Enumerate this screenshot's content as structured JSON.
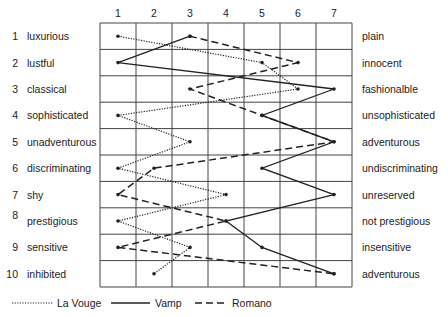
{
  "chart_data": {
    "type": "line",
    "title": "",
    "xlabel": "",
    "ylabel": "",
    "x_ticks": [
      "1",
      "2",
      "3",
      "4",
      "5",
      "6",
      "7"
    ],
    "xlim": [
      1,
      7
    ],
    "grid": true,
    "legend_position": "bottom",
    "rows": [
      {
        "num": "1",
        "left": "luxurious",
        "right": "plain"
      },
      {
        "num": "2",
        "left": "lustful",
        "right": "innocent"
      },
      {
        "num": "3",
        "left": "classical",
        "right": "fashionalble"
      },
      {
        "num": "4",
        "left": "sophisticated",
        "right": "unsophisticated"
      },
      {
        "num": "5",
        "left": "unadventurous",
        "right": "adventurous"
      },
      {
        "num": "6",
        "left": "discriminating",
        "right": "undiscriminating"
      },
      {
        "num": "7",
        "left": "shy",
        "right": "unreserved"
      },
      {
        "num": "8",
        "left": "prestigious",
        "right": "not prestigious"
      },
      {
        "num": "9",
        "left": "sensitive",
        "right": "insensitive"
      },
      {
        "num": "10",
        "left": "inhibited",
        "right": "adventurous"
      }
    ],
    "series": [
      {
        "name": "La Vouge",
        "style": "dotted",
        "values": [
          1,
          5,
          6,
          1,
          3,
          1,
          4,
          1,
          3,
          2
        ]
      },
      {
        "name": "Vamp",
        "style": "solid",
        "values": [
          3,
          1,
          7,
          5,
          7,
          5,
          7,
          4,
          5,
          7
        ]
      },
      {
        "name": "Romano",
        "style": "dashed",
        "values": [
          3,
          6,
          3,
          5,
          7,
          2,
          1,
          4,
          1,
          7
        ]
      }
    ]
  },
  "legend": {
    "items": [
      {
        "label": "La Vouge",
        "style": "dotted"
      },
      {
        "label": "Vamp",
        "style": "solid"
      },
      {
        "label": "Romano",
        "style": "dashed"
      }
    ]
  },
  "colors": {
    "line": "#222222",
    "grid": "#444444"
  }
}
